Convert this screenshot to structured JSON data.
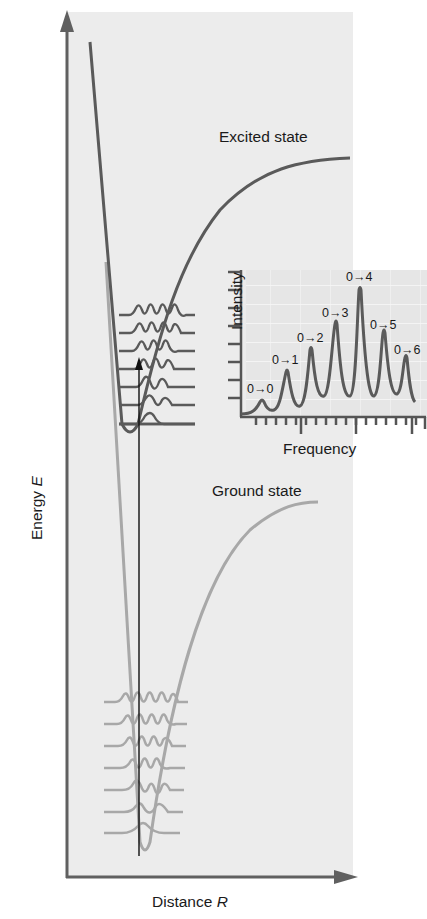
{
  "figure": {
    "axes": {
      "y_label": "Energy",
      "y_symbol": "E",
      "x_label": "Distance",
      "x_symbol": "R"
    },
    "curves": {
      "excited_label": "Excited state",
      "ground_label": "Ground state",
      "excited_color": "#5a5a5a",
      "ground_color": "#a8a8a8",
      "excited_vibrational_levels": 7,
      "ground_vibrational_levels": 7
    },
    "inset": {
      "x_label": "Frequency",
      "y_label": "Intensity",
      "peaks": [
        {
          "label": "0→0",
          "rel_intensity": 0.12
        },
        {
          "label": "0→1",
          "rel_intensity": 0.46
        },
        {
          "label": "0→2",
          "rel_intensity": 0.62
        },
        {
          "label": "0→3",
          "rel_intensity": 0.78
        },
        {
          "label": "0→4",
          "rel_intensity": 1.0
        },
        {
          "label": "0→5",
          "rel_intensity": 0.72
        },
        {
          "label": "0→6",
          "rel_intensity": 0.48
        }
      ]
    },
    "colors": {
      "panel_bg": "#ececec",
      "inset_bg": "#e4e4e4",
      "axis": "#606060",
      "transition_arrow": "#111111"
    }
  }
}
